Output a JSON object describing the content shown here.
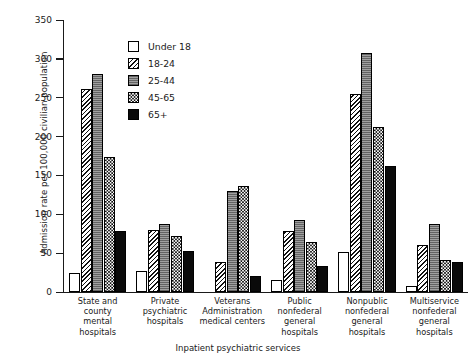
{
  "chart_data": {
    "type": "bar",
    "title": "",
    "xlabel": "Inpatient psychiatric services",
    "ylabel": "Admission rate per 100,000 civilian population",
    "ylim": [
      0,
      350
    ],
    "yticks": [
      0,
      50,
      100,
      150,
      200,
      250,
      300,
      350
    ],
    "grid": false,
    "legend_position": "upper-center-inside",
    "categories": [
      "State and county\nmental hospitals",
      "Private\npsychiatric\nhospitals",
      "Veterans\nAdministration\nmedical centers",
      "Public\nnonfederal\ngeneral\nhospitals",
      "Nonpublic\nnonfederal\ngeneral\nhospitals",
      "Multiservice\nnonfederal\ngeneral\nhospitals"
    ],
    "series": [
      {
        "name": "Under 18",
        "pattern": "solid-white",
        "values": [
          25,
          27,
          0,
          16,
          52,
          8
        ]
      },
      {
        "name": "18-24",
        "pattern": "diagonal-hatch",
        "values": [
          261,
          80,
          38,
          79,
          255,
          61
        ]
      },
      {
        "name": "25-44",
        "pattern": "gray-stipple",
        "values": [
          280,
          88,
          130,
          93,
          307,
          87
        ]
      },
      {
        "name": "45-65",
        "pattern": "checkerboard",
        "values": [
          174,
          72,
          137,
          65,
          212,
          41
        ]
      },
      {
        "name": "65+",
        "pattern": "solid-black",
        "values": [
          78,
          53,
          20,
          34,
          162,
          39
        ]
      }
    ]
  },
  "colors": {
    "axis": "#1a1a1a",
    "background": "#ffffff",
    "black_fill": "#0a0a0a",
    "gray_fill": "#8e8e8e"
  }
}
